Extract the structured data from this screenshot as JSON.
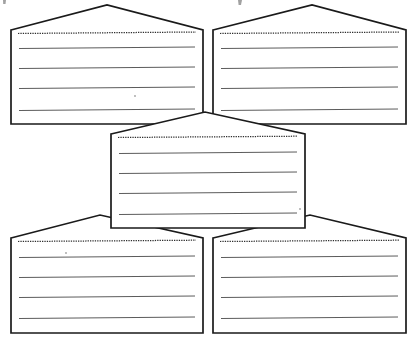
{
  "document": {
    "title": "Graphic Organizer Worksheet",
    "kind": "scanned-worksheet",
    "page_background": "#ffffff",
    "ink_color": "#1a1a1a",
    "rule_color": "#5a5a5a",
    "dotted_color": "#3a3a3a",
    "width": 416,
    "height": 341
  },
  "legend": {
    "shape_name": "pentagon-note-box",
    "lines_per_box": 4,
    "has_dotted_title_line": true
  },
  "boxes": [
    {
      "id": "box-top-left",
      "name": "top-left-note-box",
      "label": "",
      "dotted_line": "",
      "rule_lines": [
        "",
        "",
        "",
        ""
      ],
      "geometry": {
        "left_x": 11,
        "right_x": 203,
        "shoulder_y": 30,
        "peak_x": 107,
        "peak_y": 5,
        "bottom_y": 124,
        "left_shoulder_x": 11,
        "right_shoulder_x": 203
      },
      "dotted_y": 33,
      "rule_ys": [
        48,
        68,
        88,
        110
      ]
    },
    {
      "id": "box-top-right",
      "name": "top-right-note-box",
      "label": "",
      "dotted_line": "",
      "rule_lines": [
        "",
        "",
        "",
        ""
      ],
      "geometry": {
        "left_x": 213,
        "right_x": 406,
        "shoulder_y": 30,
        "peak_x": 312,
        "peak_y": 5,
        "bottom_y": 124,
        "left_shoulder_x": 213,
        "right_shoulder_x": 406
      },
      "dotted_y": 33,
      "rule_ys": [
        48,
        68,
        88,
        110
      ]
    },
    {
      "id": "box-center",
      "name": "center-note-box",
      "label": "",
      "dotted_line": "",
      "rule_lines": [
        "",
        "",
        "",
        ""
      ],
      "geometry": {
        "left_x": 111,
        "right_x": 305,
        "shoulder_y": 134,
        "peak_x": 205,
        "peak_y": 112,
        "bottom_y": 228,
        "left_shoulder_x": 111,
        "right_shoulder_x": 305
      },
      "dotted_y": 137,
      "rule_ys": [
        153,
        173,
        193,
        214
      ]
    },
    {
      "id": "box-bottom-left",
      "name": "bottom-left-note-box",
      "label": "",
      "dotted_line": "",
      "rule_lines": [
        "",
        "",
        "",
        ""
      ],
      "geometry": {
        "left_x": 11,
        "right_x": 203,
        "shoulder_y": 238,
        "peak_x": 100,
        "peak_y": 215,
        "bottom_y": 333,
        "left_shoulder_x": 11,
        "right_shoulder_x": 203
      },
      "dotted_y": 241,
      "rule_ys": [
        257,
        277,
        297,
        318
      ]
    },
    {
      "id": "box-bottom-right",
      "name": "bottom-right-note-box",
      "label": "",
      "dotted_line": "",
      "rule_lines": [
        "",
        "",
        "",
        ""
      ],
      "geometry": {
        "left_x": 213,
        "right_x": 406,
        "shoulder_y": 238,
        "peak_x": 310,
        "peak_y": 215,
        "bottom_y": 333,
        "left_shoulder_x": 213,
        "right_shoulder_x": 406
      },
      "dotted_y": 241,
      "rule_ys": [
        257,
        277,
        297,
        318
      ]
    }
  ],
  "scan_artifacts": {
    "top_edge_descenders": [
      {
        "x": 3,
        "y": 0,
        "w": 3,
        "h": 4
      },
      {
        "x": 238,
        "y": 0,
        "w": 4,
        "h": 5
      }
    ],
    "specks": [
      {
        "x": 135,
        "y": 96,
        "size": 2
      },
      {
        "x": 66,
        "y": 253,
        "size": 2
      },
      {
        "x": 300,
        "y": 209,
        "size": 2
      }
    ]
  }
}
